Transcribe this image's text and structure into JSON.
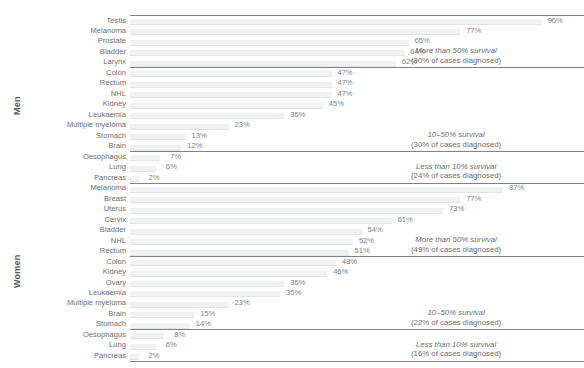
{
  "chart_data": {
    "type": "bar",
    "title": "",
    "xlabel": "Five-year relative survival",
    "ylabel": "",
    "xlim": [
      0,
      100
    ],
    "grid": false,
    "legend": null,
    "orientation": "horizontal",
    "groups": [
      {
        "name": "Men",
        "categories": [
          "Testis",
          "Melanoma",
          "Prostate",
          "Bladder",
          "Larynx",
          "Colon",
          "Rectum",
          "NHL",
          "Kidney",
          "Leukaemia",
          "Multiple myeloma",
          "Stomach",
          "Brain",
          "Oesophagus",
          "Lung",
          "Pancreas"
        ],
        "values": [
          96,
          77,
          65,
          64,
          62,
          47,
          47,
          47,
          45,
          36,
          23,
          13,
          12,
          7,
          6,
          2
        ],
        "value_labels": [
          "96%",
          "77%",
          "65%",
          "64%",
          "62%",
          "47%",
          "47%",
          "47%",
          "45%",
          "36%",
          "23%",
          "13%",
          "12%",
          "7%",
          "6%",
          "2%"
        ],
        "bands": [
          {
            "title": "More than 50% survival",
            "subtitle": "(30% of cases diagnosed)",
            "first_index": 0,
            "last_index": 4
          },
          {
            "title": "10–50% survival",
            "subtitle": "(30% of cases diagnosed)",
            "first_index": 5,
            "last_index": 12
          },
          {
            "title": "Less than 10% survival",
            "subtitle": "(24% of cases diagnosed)",
            "first_index": 13,
            "last_index": 15
          }
        ]
      },
      {
        "name": "Women",
        "categories": [
          "Melanoma",
          "Breast",
          "Uterus",
          "Cervix",
          "Bladder",
          "NHL",
          "Rectum",
          "Colon",
          "Kidney",
          "Ovary",
          "Leukaemia",
          "Multiple myeloma",
          "Brain",
          "Stomach",
          "Oesophagus",
          "Lung",
          "Pancreas"
        ],
        "values": [
          87,
          77,
          73,
          61,
          54,
          52,
          51,
          48,
          46,
          36,
          35,
          23,
          15,
          14,
          8,
          6,
          2
        ],
        "value_labels": [
          "87%",
          "77%",
          "73%",
          "61%",
          "54%",
          "52%",
          "51%",
          "48%",
          "46%",
          "36%",
          "35%",
          "23%",
          "15%",
          "14%",
          "8%",
          "6%",
          "2%"
        ],
        "bands": [
          {
            "title": "More than 50% survival",
            "subtitle": "(49% of cases diagnosed)",
            "first_index": 0,
            "last_index": 6
          },
          {
            "title": "10–50% survival",
            "subtitle": "(22% of cases diagnosed)",
            "first_index": 7,
            "last_index": 13
          },
          {
            "title": "Less than 10% survival",
            "subtitle": "(16% of cases diagnosed)",
            "first_index": 14,
            "last_index": 16
          }
        ]
      }
    ],
    "colors": {
      "bar": "#f0f1f2",
      "bar_edge": "#e3e4e6",
      "divider": "#808285",
      "text": "#6d6e71",
      "title_text": "#58595b"
    }
  }
}
